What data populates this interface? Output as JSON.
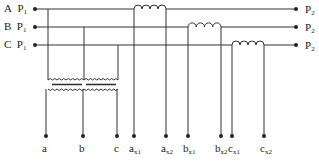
{
  "diagram": {
    "phases": [
      {
        "letter": "A",
        "start_label": "P",
        "start_sub": "1",
        "end_label": "P",
        "end_sub": "2"
      },
      {
        "letter": "B",
        "start_label": "P",
        "start_sub": "1",
        "end_label": "P",
        "end_sub": "2"
      },
      {
        "letter": "C",
        "start_label": "P",
        "start_sub": "1",
        "end_label": "P",
        "end_sub": "2"
      }
    ],
    "terminals": [
      {
        "main": "a",
        "sub": ""
      },
      {
        "main": "b",
        "sub": ""
      },
      {
        "main": "c",
        "sub": ""
      },
      {
        "main": "a",
        "sub": "x1"
      },
      {
        "main": "a",
        "sub": "x2"
      },
      {
        "main": "b",
        "sub": "x1"
      },
      {
        "main": "b",
        "sub": "x2"
      },
      {
        "main": "c",
        "sub": "x1"
      },
      {
        "main": "c",
        "sub": "x2"
      }
    ],
    "colors": {
      "line": "#333333",
      "background": "#ffffff"
    }
  }
}
